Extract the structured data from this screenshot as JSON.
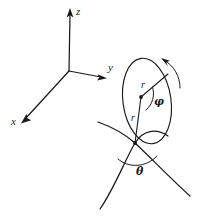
{
  "figure": {
    "background_color": "#ffffff",
    "ink_color": "#1a1a1a",
    "width": 198,
    "height": 218
  },
  "axes": {
    "origin": {
      "x": 69,
      "y": 71
    },
    "items": [
      {
        "id": "z",
        "label": "z",
        "tip": {
          "x": 70,
          "y": 10
        },
        "direction": "up"
      },
      {
        "id": "y",
        "label": "y",
        "tip": {
          "x": 106,
          "y": 79
        },
        "direction": "right"
      },
      {
        "id": "x",
        "label": "x",
        "tip": {
          "x": 21,
          "y": 123
        },
        "direction": "down-left"
      }
    ]
  },
  "ring": {
    "name": "rotation-circle",
    "center": {
      "x": 147,
      "y": 101
    },
    "rx": 24,
    "ry": 43,
    "tilt_deg": -8,
    "rotation_arrow": "clockwise"
  },
  "radii": [
    {
      "id": "r-upper",
      "label": "r",
      "from": {
        "x": 141,
        "y": 97
      },
      "to": {
        "x": 168,
        "y": 75
      }
    },
    {
      "id": "r-lower",
      "label": "r",
      "from": {
        "x": 141,
        "y": 97
      },
      "to": {
        "x": 135,
        "y": 143
      }
    }
  ],
  "angles": [
    {
      "id": "phi",
      "label": "φ",
      "vertex": {
        "x": 141,
        "y": 97
      },
      "between": [
        "r-upper",
        "r-lower"
      ]
    },
    {
      "id": "theta",
      "label": "θ",
      "vertex": {
        "x": 135,
        "y": 143
      },
      "between": [
        "curve-left",
        "curve-right"
      ]
    }
  ],
  "curves": [
    {
      "id": "curve-left",
      "from": {
        "x": 98,
        "y": 122
      },
      "to": {
        "x": 190,
        "y": 196
      },
      "description": "upper-left to lower-right arc through node"
    },
    {
      "id": "curve-right",
      "from": {
        "x": 100,
        "y": 209
      },
      "to": {
        "x": 168,
        "y": 136
      },
      "description": "lower-left to upper-right arc through node"
    }
  ],
  "node": {
    "id": "intersection-node",
    "x": 135,
    "y": 143
  }
}
